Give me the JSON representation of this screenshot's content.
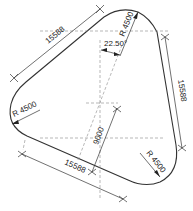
{
  "drawing": {
    "type": "rounded triangle plan",
    "stroke_color": "#333333",
    "center_line_color": "#777777",
    "dimensions": {
      "side_top_left": "15588",
      "side_right": "15588",
      "side_bottom": "15588",
      "radius_top_label": "R 4500",
      "radius_left_label": "R 4500",
      "radius_bottom_right_label": "R 4500",
      "height_label": "9000",
      "angle_label": "22.50°"
    }
  }
}
